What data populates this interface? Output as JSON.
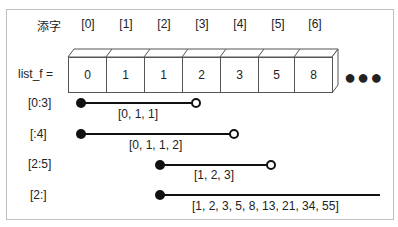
{
  "header": {
    "subscript_label": "添字",
    "list_label": "list_f ="
  },
  "indices": [
    "[0]",
    "[1]",
    "[2]",
    "[3]",
    "[4]",
    "[5]",
    "[6]"
  ],
  "cells": [
    "0",
    "1",
    "1",
    "2",
    "3",
    "5",
    "8"
  ],
  "ellipsis": "●●●",
  "slices": [
    {
      "label": "[0:3]",
      "result": "[0, 1, 1]",
      "end": "open"
    },
    {
      "label": "[:4]",
      "result": "[0, 1, 1, 2]",
      "end": "open"
    },
    {
      "label": "[2:5]",
      "result": "[1, 2, 3]",
      "end": "open"
    },
    {
      "label": "[2:]",
      "result": "[1, 2, 3, 5, 8, 13, 21, 34, 55]",
      "end": "continues"
    }
  ],
  "colors": {
    "line": "#111111",
    "border": "#bfbfbf",
    "cell_border": "#555555"
  }
}
